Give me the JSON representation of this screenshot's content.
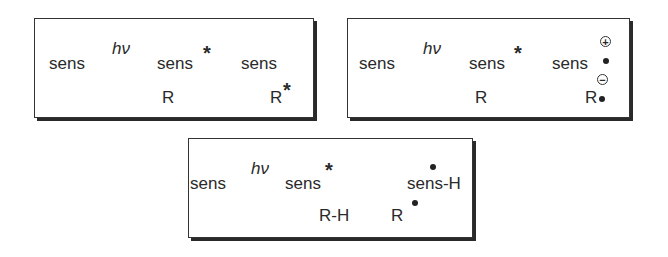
{
  "panels": [
    {
      "id": "energy-transfer",
      "start": "sens",
      "light": "hν",
      "excited": "sens",
      "excited_mark": "*",
      "product_top": "sens",
      "reactant": "R",
      "product_bottom": "R",
      "product_bottom_mark": "*"
    },
    {
      "id": "electron-transfer",
      "start": "sens",
      "light": "hν",
      "excited": "sens",
      "excited_mark": "*",
      "product_top": "sens",
      "product_top_charge": "+",
      "reactant": "R",
      "product_bottom": "R",
      "product_bottom_charge": "−"
    },
    {
      "id": "hydrogen-abstraction",
      "start": "sens",
      "light": "hν",
      "excited": "sens",
      "excited_mark": "*",
      "product_top": "sens-H",
      "reactant": "R-H",
      "product_bottom": "R"
    }
  ]
}
